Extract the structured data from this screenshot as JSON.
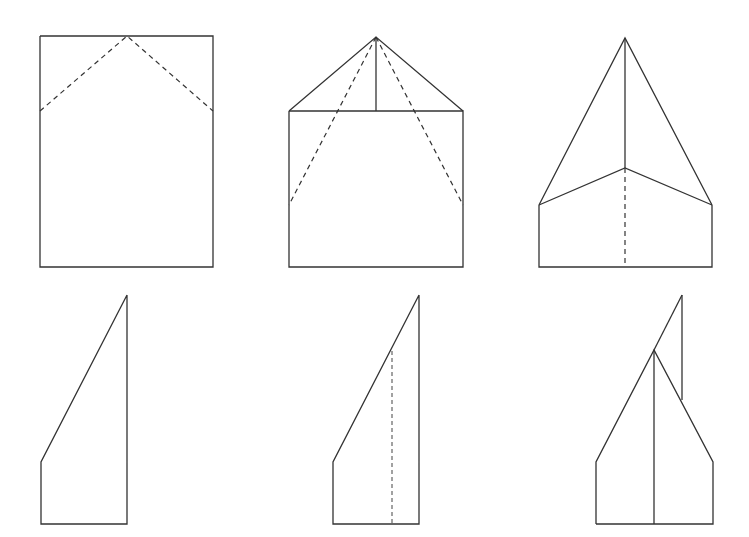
{
  "diagram": {
    "colors": {
      "line": "#333333",
      "background": "#ffffff"
    },
    "steps": [
      {
        "id": 1,
        "description": "Rectangle sheet with two dashed diagonal fold lines from top center",
        "solid": [
          "40,36 213,36 213,267 40,267 40,36"
        ],
        "dashed": [
          "40,111 127,36 213,111"
        ]
      },
      {
        "id": 2,
        "description": "Top corners folded down forming triangle, with dashed lines for next fold",
        "solid": [
          "289,111 376,37 463,111",
          "289,111 463,111 463,267 289,267 289,111",
          "376,37 376,111"
        ],
        "dashed": [
          "376,37 289,205",
          "376,37 463,205"
        ]
      },
      {
        "id": 3,
        "description": "Sides folded to center forming pointed nose; dashed center fold line",
        "solid": [
          "539,205 625,38 712,205",
          "539,205 625,168 712,205",
          "625,38 625,168",
          "539,205 539,267 712,267 712,205"
        ],
        "dashed": [
          "625,168 625,267"
        ]
      },
      {
        "id": 4,
        "description": "Folded in half along center",
        "solid": [
          "127,295 127,524 41,524 41,462 127,295"
        ],
        "dashed": []
      },
      {
        "id": 5,
        "description": "Dashed line marks wing fold",
        "solid": [
          "419,295 419,524 333,524 333,462 419,295"
        ],
        "dashed": [
          "392,351 392,524"
        ]
      },
      {
        "id": 6,
        "description": "Wings folded down; finished paper airplane",
        "solid": [
          "682,295 682,400",
          "682,295 654,350",
          "596,524 596,462 654,350 713,462 713,524 596,524",
          "654,350 654,524"
        ],
        "dashed": []
      }
    ]
  }
}
